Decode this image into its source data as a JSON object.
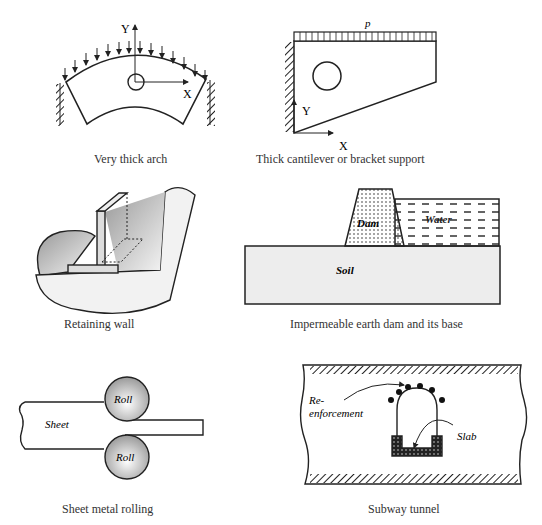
{
  "figures": [
    {
      "id": "arch",
      "caption": "Very thick arch",
      "labels": {
        "y_axis": "Y",
        "x_axis": "X"
      }
    },
    {
      "id": "cantilever",
      "caption": "Thick cantilever or bracket support",
      "labels": {
        "load": "p",
        "y_axis": "Y",
        "x_axis": "X"
      }
    },
    {
      "id": "retaining-wall",
      "caption": "Retaining wall",
      "labels": {}
    },
    {
      "id": "dam",
      "caption": "Impermeable earth dam and its base",
      "labels": {
        "dam": "Dam",
        "water": "Water",
        "soil": "Soil"
      }
    },
    {
      "id": "rolling",
      "caption": "Sheet metal rolling",
      "labels": {
        "roll_top": "Roll",
        "roll_bottom": "Roll",
        "sheet": "Sheet"
      }
    },
    {
      "id": "tunnel",
      "caption": "Subway tunnel",
      "labels": {
        "reinforcement_1": "Re-",
        "reinforcement_2": "enforcement",
        "slab": "Slab"
      }
    }
  ]
}
